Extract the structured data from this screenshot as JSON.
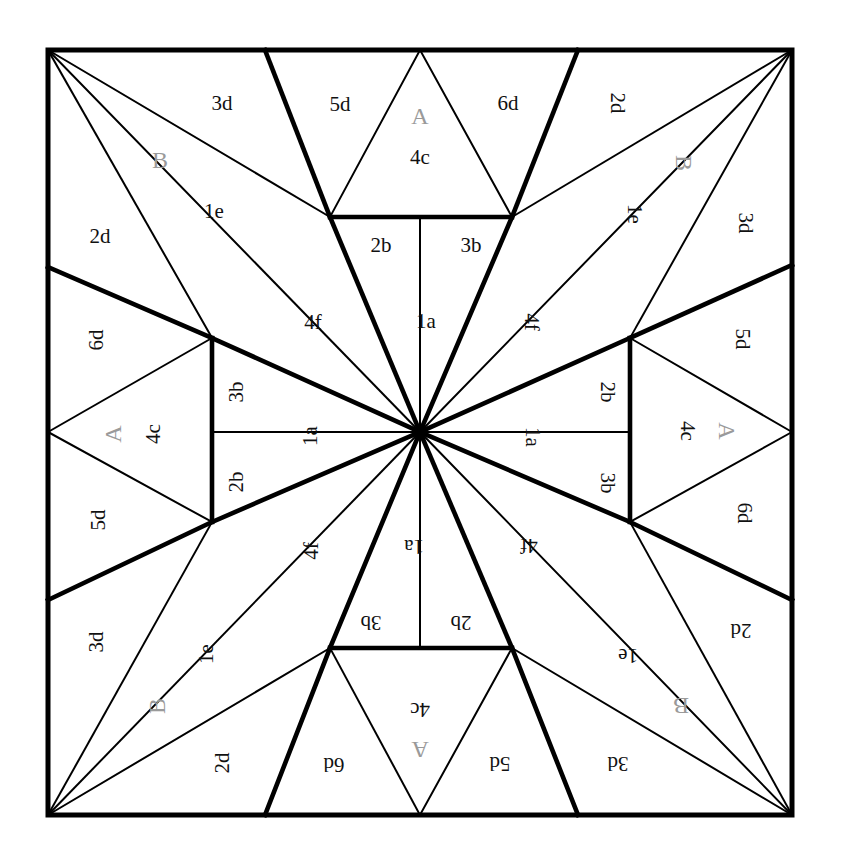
{
  "diagram": {
    "type": "geometric-tiling",
    "frame": {
      "x0": 48,
      "y0": 50,
      "x1": 792,
      "y1": 815,
      "stroke_color": "#000000",
      "stroke_width_outer": 5,
      "stroke_width_thick": 4.6,
      "stroke_width_thin": 2.0
    },
    "colors": {
      "line": "#000000",
      "label_black": "#111111",
      "label_gray": "#9a9a9a",
      "background": "#ffffff"
    },
    "vertices": {
      "center": [
        420,
        432
      ],
      "top_mid": [
        420,
        50
      ],
      "bottom_mid": [
        420,
        815
      ],
      "left_mid": [
        48,
        432
      ],
      "right_mid": [
        792,
        432
      ],
      "top_left_node": [
        330,
        217
      ],
      "top_right_node": [
        512,
        217
      ],
      "left_top_node": [
        212,
        338
      ],
      "left_bottom_node": [
        212,
        522
      ],
      "right_top_node": [
        630,
        338
      ],
      "right_bottom_node": [
        630,
        522
      ],
      "bottom_left_node": [
        330,
        648
      ],
      "bottom_right_node": [
        512,
        648
      ],
      "top_edge_left": [
        265,
        50
      ],
      "top_edge_right": [
        578,
        50
      ],
      "bottom_edge_left": [
        265,
        815
      ],
      "bottom_edge_right": [
        578,
        815
      ],
      "left_edge_upper": [
        48,
        267
      ],
      "left_edge_lower": [
        48,
        600
      ],
      "right_edge_upper": [
        792,
        265
      ],
      "right_edge_lower": [
        792,
        600
      ]
    },
    "labels": [
      {
        "id": "t-3d",
        "text": "3d",
        "x": 222,
        "y": 103,
        "rot": 0,
        "style": "black"
      },
      {
        "id": "t-B",
        "text": "B",
        "x": 160,
        "y": 160,
        "rot": 0,
        "style": "gray"
      },
      {
        "id": "t-1e",
        "text": "1e",
        "x": 214,
        "y": 211,
        "rot": 0,
        "style": "black"
      },
      {
        "id": "t-2d",
        "text": "2d",
        "x": 100,
        "y": 236,
        "rot": 0,
        "style": "black"
      },
      {
        "id": "t-5d",
        "text": "5d",
        "x": 340,
        "y": 104,
        "rot": 0,
        "style": "black"
      },
      {
        "id": "t-A",
        "text": "A",
        "x": 420,
        "y": 116,
        "rot": 0,
        "style": "gray"
      },
      {
        "id": "t-4c",
        "text": "4c",
        "x": 420,
        "y": 157,
        "rot": 0,
        "style": "black"
      },
      {
        "id": "t-6d",
        "text": "6d",
        "x": 508,
        "y": 103,
        "rot": 0,
        "style": "black"
      },
      {
        "id": "t-2b",
        "text": "2b",
        "x": 381,
        "y": 245,
        "rot": 0,
        "style": "black"
      },
      {
        "id": "t-3b",
        "text": "3b",
        "x": 471,
        "y": 245,
        "rot": 0,
        "style": "black"
      },
      {
        "id": "t-1a",
        "text": "1a",
        "x": 426,
        "y": 321,
        "rot": 0,
        "style": "black"
      },
      {
        "id": "t-4f",
        "text": "4f",
        "x": 313,
        "y": 322,
        "rot": 0,
        "style": "black"
      },
      {
        "id": "r-2d",
        "text": "2d",
        "x": 617,
        "y": 103,
        "rot": 90,
        "style": "black"
      },
      {
        "id": "r-B",
        "text": "B",
        "x": 684,
        "y": 163,
        "rot": 90,
        "style": "gray"
      },
      {
        "id": "r-1e",
        "text": "1e",
        "x": 634,
        "y": 214,
        "rot": 90,
        "style": "black"
      },
      {
        "id": "r-3d",
        "text": "3d",
        "x": 745,
        "y": 223,
        "rot": 90,
        "style": "black"
      },
      {
        "id": "r-5d",
        "text": "5d",
        "x": 742,
        "y": 339,
        "rot": 90,
        "style": "black"
      },
      {
        "id": "r-A",
        "text": "A",
        "x": 727,
        "y": 431,
        "rot": 90,
        "style": "gray"
      },
      {
        "id": "r-4c",
        "text": "4c",
        "x": 687,
        "y": 431,
        "rot": 90,
        "style": "black"
      },
      {
        "id": "r-6d",
        "text": "6d",
        "x": 744,
        "y": 513,
        "rot": 90,
        "style": "black"
      },
      {
        "id": "r-2b",
        "text": "2b",
        "x": 607,
        "y": 392,
        "rot": 90,
        "style": "black"
      },
      {
        "id": "r-3b",
        "text": "3b",
        "x": 607,
        "y": 483,
        "rot": 90,
        "style": "black"
      },
      {
        "id": "r-1a",
        "text": "1a",
        "x": 532,
        "y": 437,
        "rot": 90,
        "style": "black"
      },
      {
        "id": "r-4f",
        "text": "4f",
        "x": 531,
        "y": 322,
        "rot": 90,
        "style": "black"
      },
      {
        "id": "b-3d",
        "text": "3d",
        "x": 618,
        "y": 763,
        "rot": 180,
        "style": "black"
      },
      {
        "id": "b-B",
        "text": "B",
        "x": 681,
        "y": 706,
        "rot": 180,
        "style": "gray"
      },
      {
        "id": "b-1e",
        "text": "1e",
        "x": 628,
        "y": 655,
        "rot": 180,
        "style": "black"
      },
      {
        "id": "b-2d",
        "text": "2d",
        "x": 741,
        "y": 630,
        "rot": 180,
        "style": "black"
      },
      {
        "id": "b-5d",
        "text": "5d",
        "x": 500,
        "y": 763,
        "rot": 180,
        "style": "black"
      },
      {
        "id": "b-A",
        "text": "A",
        "x": 420,
        "y": 750,
        "rot": 180,
        "style": "gray"
      },
      {
        "id": "b-4c",
        "text": "4c",
        "x": 420,
        "y": 709,
        "rot": 180,
        "style": "black"
      },
      {
        "id": "b-6d",
        "text": "6d",
        "x": 334,
        "y": 764,
        "rot": 180,
        "style": "black"
      },
      {
        "id": "b-2b",
        "text": "2b",
        "x": 461,
        "y": 622,
        "rot": 180,
        "style": "black"
      },
      {
        "id": "b-3b",
        "text": "3b",
        "x": 371,
        "y": 622,
        "rot": 180,
        "style": "black"
      },
      {
        "id": "b-1a",
        "text": "1a",
        "x": 414,
        "y": 546,
        "rot": 180,
        "style": "black"
      },
      {
        "id": "b-4f",
        "text": "4f",
        "x": 529,
        "y": 545,
        "rot": 180,
        "style": "black"
      },
      {
        "id": "l-2d",
        "text": "2d",
        "x": 222,
        "y": 763,
        "rot": 270,
        "style": "black"
      },
      {
        "id": "l-B",
        "text": "B",
        "x": 157,
        "y": 706,
        "rot": 270,
        "style": "gray"
      },
      {
        "id": "l-1e",
        "text": "1e",
        "x": 206,
        "y": 654,
        "rot": 270,
        "style": "black"
      },
      {
        "id": "l-3d",
        "text": "3d",
        "x": 96,
        "y": 642,
        "rot": 270,
        "style": "black"
      },
      {
        "id": "l-5d",
        "text": "5d",
        "x": 98,
        "y": 520,
        "rot": 270,
        "style": "black"
      },
      {
        "id": "l-A",
        "text": "A",
        "x": 113,
        "y": 434,
        "rot": 270,
        "style": "gray"
      },
      {
        "id": "l-4c",
        "text": "4c",
        "x": 153,
        "y": 434,
        "rot": 270,
        "style": "black"
      },
      {
        "id": "l-6d",
        "text": "6d",
        "x": 96,
        "y": 340,
        "rot": 270,
        "style": "black"
      },
      {
        "id": "l-3b",
        "text": "3b",
        "x": 236,
        "y": 392,
        "rot": 270,
        "style": "black"
      },
      {
        "id": "l-2b",
        "text": "2b",
        "x": 236,
        "y": 482,
        "rot": 270,
        "style": "black"
      },
      {
        "id": "l-1a",
        "text": "1a",
        "x": 310,
        "y": 436,
        "rot": 270,
        "style": "black"
      },
      {
        "id": "l-4f",
        "text": "4f",
        "x": 311,
        "y": 551,
        "rot": 270,
        "style": "black"
      }
    ],
    "lines": {
      "thick": [
        [
          265,
          50,
          330,
          217
        ],
        [
          578,
          50,
          512,
          217
        ],
        [
          48,
          267,
          212,
          338
        ],
        [
          792,
          265,
          630,
          338
        ],
        [
          48,
          600,
          212,
          522
        ],
        [
          792,
          600,
          630,
          522
        ],
        [
          265,
          815,
          330,
          648
        ],
        [
          578,
          815,
          512,
          648
        ],
        [
          330,
          217,
          420,
          432
        ],
        [
          512,
          217,
          420,
          432
        ],
        [
          212,
          338,
          420,
          432
        ],
        [
          630,
          338,
          420,
          432
        ],
        [
          212,
          522,
          420,
          432
        ],
        [
          630,
          522,
          420,
          432
        ],
        [
          330,
          648,
          420,
          432
        ],
        [
          512,
          648,
          420,
          432
        ],
        [
          330,
          217,
          512,
          217
        ],
        [
          330,
          648,
          512,
          648
        ],
        [
          212,
          338,
          212,
          522
        ],
        [
          630,
          338,
          630,
          522
        ]
      ],
      "thin": [
        [
          48,
          50,
          330,
          217
        ],
        [
          48,
          50,
          212,
          338
        ],
        [
          48,
          50,
          420,
          432
        ],
        [
          792,
          50,
          512,
          217
        ],
        [
          792,
          50,
          630,
          338
        ],
        [
          792,
          50,
          420,
          432
        ],
        [
          48,
          815,
          330,
          648
        ],
        [
          48,
          815,
          212,
          522
        ],
        [
          48,
          815,
          420,
          432
        ],
        [
          792,
          815,
          512,
          648
        ],
        [
          792,
          815,
          630,
          522
        ],
        [
          792,
          815,
          420,
          432
        ],
        [
          420,
          50,
          330,
          217
        ],
        [
          420,
          50,
          512,
          217
        ],
        [
          420,
          217,
          330,
          217
        ],
        [
          420,
          217,
          512,
          217
        ],
        [
          420,
          217,
          420,
          432
        ],
        [
          420,
          815,
          330,
          648
        ],
        [
          420,
          815,
          512,
          648
        ],
        [
          420,
          648,
          330,
          648
        ],
        [
          420,
          648,
          512,
          648
        ],
        [
          420,
          648,
          420,
          432
        ],
        [
          48,
          432,
          212,
          338
        ],
        [
          48,
          432,
          212,
          522
        ],
        [
          212,
          432,
          212,
          338
        ],
        [
          212,
          432,
          212,
          522
        ],
        [
          212,
          432,
          420,
          432
        ],
        [
          792,
          432,
          630,
          338
        ],
        [
          792,
          432,
          630,
          522
        ],
        [
          630,
          432,
          630,
          338
        ],
        [
          630,
          432,
          630,
          522
        ],
        [
          630,
          432,
          420,
          432
        ]
      ]
    }
  }
}
